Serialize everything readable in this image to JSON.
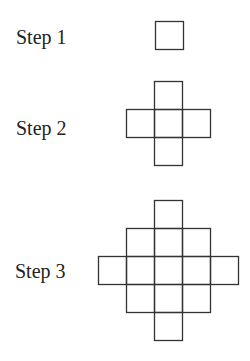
{
  "steps": [
    {
      "label": "Step 1",
      "label_x": 16,
      "label_y": 27,
      "cells": [
        [
          0,
          0
        ]
      ],
      "origin": [
        155,
        21
      ]
    },
    {
      "label": "Step 2",
      "label_x": 16,
      "label_y": 118,
      "cells": [
        [
          1,
          0
        ],
        [
          0,
          1
        ],
        [
          1,
          1
        ],
        [
          2,
          1
        ],
        [
          1,
          2
        ]
      ],
      "origin": [
        126,
        81
      ]
    },
    {
      "label": "Step 3",
      "label_x": 15,
      "label_y": 268,
      "cells": [
        [
          2,
          0
        ],
        [
          1,
          1
        ],
        [
          2,
          1
        ],
        [
          3,
          1
        ],
        [
          0,
          2
        ],
        [
          1,
          2
        ],
        [
          2,
          2
        ],
        [
          3,
          2
        ],
        [
          4,
          2
        ],
        [
          1,
          3
        ],
        [
          2,
          3
        ],
        [
          3,
          3
        ],
        [
          2,
          4
        ]
      ],
      "origin": [
        98,
        200
      ]
    }
  ],
  "cell_size": 28,
  "stroke_color": "#333333"
}
